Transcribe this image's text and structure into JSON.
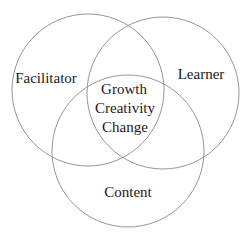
{
  "diagram": {
    "type": "venn",
    "sets": [
      {
        "id": "facilitator",
        "label": "Facilitator",
        "cx": 88,
        "cy": 90,
        "r": 76
      },
      {
        "id": "learner",
        "label": "Learner",
        "cx": 163,
        "cy": 93,
        "r": 76
      },
      {
        "id": "content",
        "label": "Content",
        "cx": 128,
        "cy": 151,
        "r": 76
      }
    ],
    "intersection": {
      "lines": [
        "Growth",
        "Creativity",
        "Change"
      ]
    },
    "stroke_color": "#8a8a8a",
    "text_color": "#1a1a1a"
  }
}
